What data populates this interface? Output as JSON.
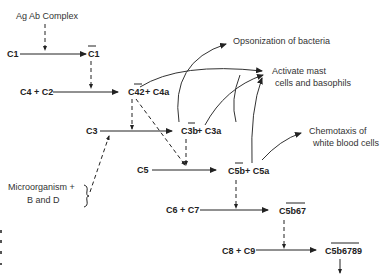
{
  "diagram": {
    "trigger": "Ag Ab Complex",
    "nodes": {
      "c1": "C1",
      "c1_active": "C1",
      "c4c2": "C4 + C2",
      "c42": "C42",
      "c4a": "+ C4a",
      "c3": "C3",
      "c3b": "C3b",
      "c3a": "+ C3a",
      "c5": "C5",
      "c5b": "C5b",
      "c5a": "+ C5a",
      "c6c7": "C6 + C7",
      "c5b67": "C5b67",
      "c8c9": "C8 + C9",
      "c5b6789": "C5b6789"
    },
    "alt_pathway": [
      "Microorganism +",
      "B and D"
    ],
    "effects": {
      "opsonization": "Opsonization of bacteria",
      "mast": [
        "Activate mast",
        "cells and basophils"
      ],
      "chemotaxis": [
        "Chemotaxis of",
        "white blood cells"
      ]
    }
  }
}
